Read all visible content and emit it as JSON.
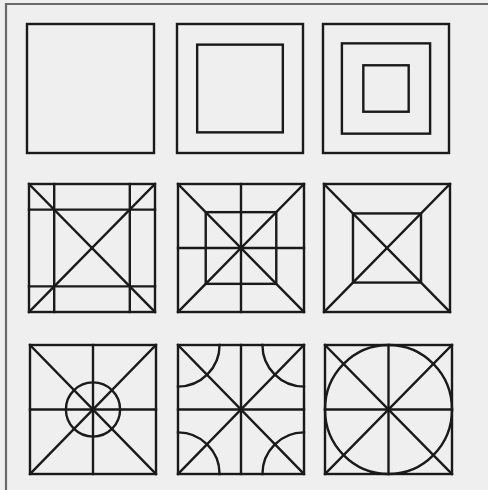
{
  "figure": {
    "background": "#efefef",
    "frame_color": "#6a6a6a",
    "stroke_color": "#1a1a1a",
    "stroke_width": 2.4,
    "grid": {
      "rows": 3,
      "cols": 3
    },
    "panels": [
      {
        "id": "r1c1",
        "x": 27,
        "y": 24,
        "w": 127,
        "h": 129,
        "pattern": "plain-square"
      },
      {
        "id": "r1c2",
        "x": 177,
        "y": 24,
        "w": 126,
        "h": 129,
        "pattern": "one-inset-square"
      },
      {
        "id": "r1c3",
        "x": 323,
        "y": 24,
        "w": 126,
        "h": 129,
        "pattern": "two-inset-squares"
      },
      {
        "id": "r2c1",
        "x": 29,
        "y": 184,
        "w": 126,
        "h": 128,
        "pattern": "diagonals-with-border-grid"
      },
      {
        "id": "r2c2",
        "x": 178,
        "y": 184,
        "w": 126,
        "h": 128,
        "pattern": "diagonals-cross-inner-square"
      },
      {
        "id": "r2c3",
        "x": 324,
        "y": 184,
        "w": 126,
        "h": 128,
        "pattern": "diagonals-inner-square"
      },
      {
        "id": "r3c1",
        "x": 30,
        "y": 345,
        "w": 126,
        "h": 129,
        "pattern": "diagonals-cross-center-circle"
      },
      {
        "id": "r3c2",
        "x": 178,
        "y": 345,
        "w": 126,
        "h": 129,
        "pattern": "diagonals-cross-corner-arcs"
      },
      {
        "id": "r3c3",
        "x": 325,
        "y": 345,
        "w": 127,
        "h": 129,
        "pattern": "diagonals-cross-astroid"
      }
    ]
  }
}
